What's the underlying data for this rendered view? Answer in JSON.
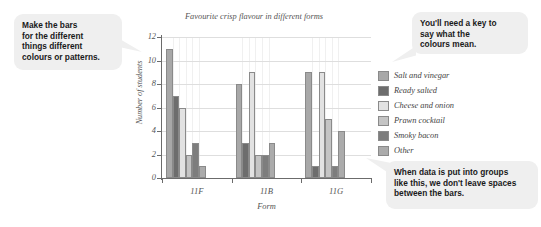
{
  "callouts": [
    {
      "id": "bars",
      "lines": [
        "Make the bars",
        "for the different",
        "things different",
        "colours or patterns."
      ]
    },
    {
      "id": "key",
      "lines": [
        "You'll need a key to",
        "say what the",
        "colours mean."
      ]
    },
    {
      "id": "groups",
      "lines": [
        "When data is put into groups",
        "like this, we don't leave spaces",
        "between the bars."
      ]
    }
  ],
  "chart_data": {
    "type": "bar",
    "title": "Favourite crisp flavour in different forms",
    "xlabel": "Form",
    "ylabel": "Number of students",
    "categories": [
      "11F",
      "11B",
      "11G"
    ],
    "ylim": [
      0,
      12
    ],
    "yticks": [
      0,
      2,
      4,
      6,
      8,
      10,
      12
    ],
    "grid": true,
    "legend_position": "right",
    "series": [
      {
        "name": "Salt and vinegar",
        "color": "#a8a8a8",
        "values": [
          11,
          8,
          9
        ]
      },
      {
        "name": "Ready salted",
        "color": "#6d6d6d",
        "values": [
          7,
          3,
          1
        ]
      },
      {
        "name": "Cheese and onion",
        "color": "#e2e2e2",
        "values": [
          6,
          9,
          9
        ]
      },
      {
        "name": "Prawn cocktail",
        "color": "#c4c4c4",
        "values": [
          2,
          2,
          5
        ]
      },
      {
        "name": "Smoky bacon",
        "color": "#7d7d7d",
        "values": [
          3,
          2,
          1
        ]
      },
      {
        "name": "Other",
        "color": "#ababab",
        "values": [
          1,
          3,
          4
        ]
      }
    ]
  }
}
